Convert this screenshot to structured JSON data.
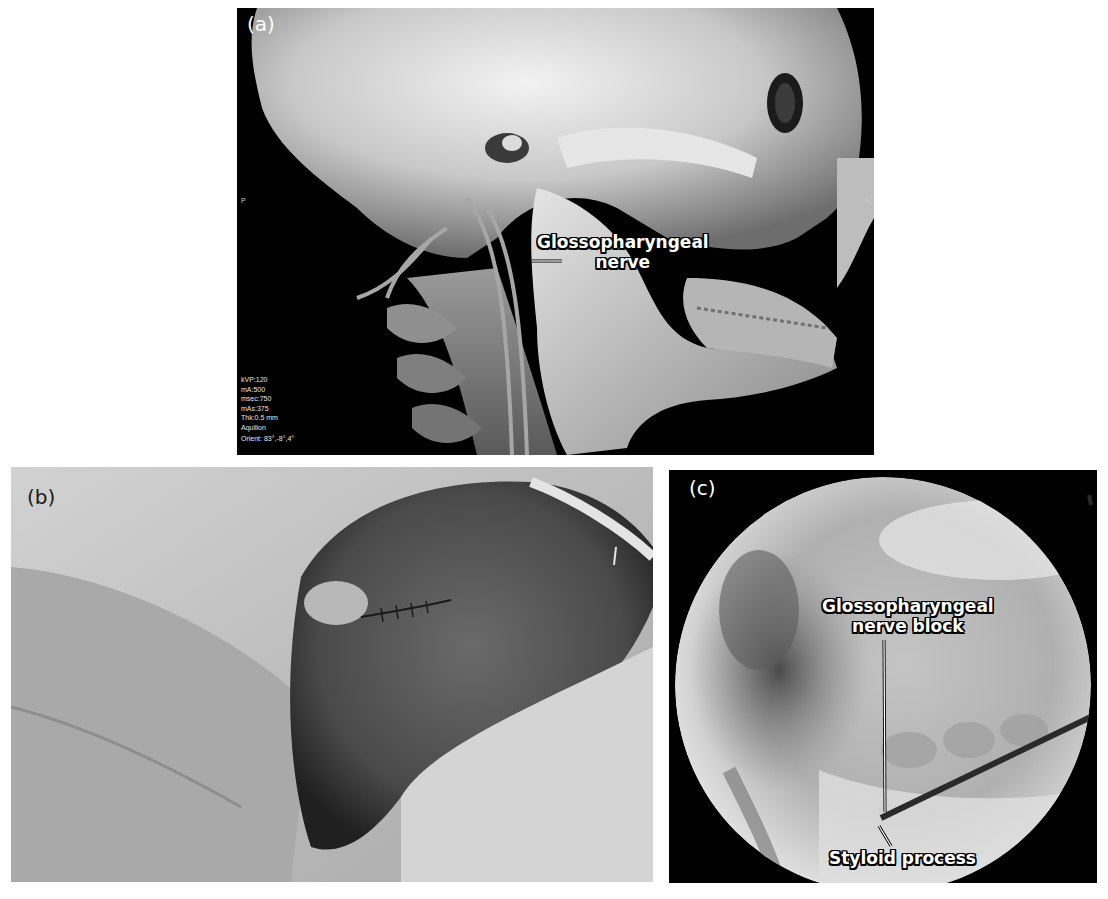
{
  "figure": {
    "panels": [
      {
        "id": "a",
        "label": "(a)",
        "kind": "3D CT volume rendering of skull and neck vasculature, lateral view",
        "callouts": [
          {
            "line1": "Glossopharyngeal",
            "line2": "nerve"
          }
        ],
        "orientation_markers": {
          "left": "P",
          "right": "A"
        },
        "scan_parameters": [
          "kVP:120",
          "mA:500",
          "msec:750",
          "mAs:375",
          "Thk:0.5 mm",
          "Aquilion",
          "Orient: 83°,-8°,4°"
        ]
      },
      {
        "id": "b",
        "label": "(b)",
        "kind": "Clinical photograph of draped patient neck with sutured incision"
      },
      {
        "id": "c",
        "label": "(c)",
        "kind": "Fluoroscopic image showing needle placement",
        "callouts": [
          {
            "line1": "Glossopharyngeal",
            "line2": "nerve block"
          },
          {
            "line1": "Styloid process"
          }
        ]
      }
    ],
    "colors": {
      "background": "#ffffff",
      "panel_dark": "#000000",
      "drape": "#c9c9c9",
      "callout_fill": "#ffffff",
      "callout_outline": "#000000"
    }
  }
}
